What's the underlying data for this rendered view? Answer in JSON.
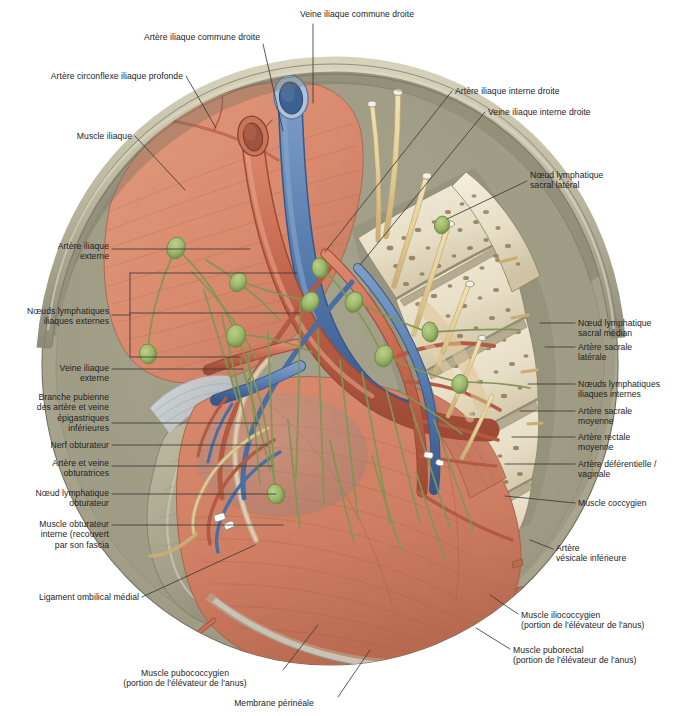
{
  "figure": {
    "type": "anatomical-illustration",
    "language": "fr",
    "palette": {
      "artery": "#c4684f",
      "artery_dark": "#9e4a36",
      "vein": "#5a7fb0",
      "vein_dark": "#3c5f8e",
      "lymph_vessel": "#7f9654",
      "lymph_node": "#9ab668",
      "nerve": "#e3cf9a",
      "nerve_dark": "#c4ab6c",
      "muscle": "#d98a6e",
      "muscle_dark": "#bb6b50",
      "bone": "#efe7d4",
      "bone_spot": "#8a7352",
      "fascia": "#b3b09a",
      "peritoneum": "#c9c6ab",
      "rim": "#b9b49a",
      "shadow": "#7d7b6c",
      "label_text": "#1d1d1f",
      "leader": "#3a3a3a"
    },
    "labels": [
      {
        "id": "veine-iliaque-commune-droite",
        "text": "Veine iliaque commune droite",
        "align": "center",
        "x": 277,
        "y": 9,
        "w": 160
      },
      {
        "id": "artere-iliaque-commune-droite",
        "text": "Artère iliaque commune droite",
        "align": "right",
        "x": 8,
        "y": 32,
        "w": 252
      },
      {
        "id": "artere-circonflexe-iliaque-profonde",
        "text": "Artère circonflexe iliaque profonde",
        "align": "right",
        "x": 6,
        "y": 71,
        "w": 177
      },
      {
        "id": "muscle-iliaque",
        "text": "Muscle iliaque",
        "align": "right",
        "x": 6,
        "y": 131,
        "w": 126
      },
      {
        "id": "artere-iliaque-interne-droite",
        "text": "Artère iliaque interne droite",
        "align": "left",
        "x": 455,
        "y": 86,
        "w": 180
      },
      {
        "id": "veine-iliaque-interne-droite",
        "text": "Veine iliaque interne droite",
        "align": "left",
        "x": 488,
        "y": 107,
        "w": 180
      },
      {
        "id": "noeud-lymphatique-sacral-lateral",
        "text": "Nœud lymphatique\nsacral latéral",
        "align": "left",
        "x": 530,
        "y": 170,
        "w": 140
      },
      {
        "id": "artere-iliaque-externe",
        "text": "Artère iliaque\nexterne",
        "align": "right",
        "x": 6,
        "y": 241,
        "w": 103
      },
      {
        "id": "noeuds-lymphatiques-iliaques-externes",
        "text": "Nœuds lymphatiques\niliaques externes",
        "align": "right",
        "x": 2,
        "y": 306,
        "w": 107
      },
      {
        "id": "veine-iliaque-externe",
        "text": "Veine iliaque\nexterne",
        "align": "right",
        "x": 6,
        "y": 363,
        "w": 103
      },
      {
        "id": "branche-pubienne",
        "text": "Branche pubienne\ndes artère et veine\népigastriques\ninférieures",
        "align": "right",
        "x": 6,
        "y": 392,
        "w": 103
      },
      {
        "id": "nerf-obturateur",
        "text": "Nerf obturateur",
        "align": "right",
        "x": 6,
        "y": 440,
        "w": 103
      },
      {
        "id": "artere-et-veine-obturatrices",
        "text": "Artère et veine\nobturatrices",
        "align": "right",
        "x": 6,
        "y": 458,
        "w": 103
      },
      {
        "id": "noeud-lymphatique-obturateur",
        "text": "Nœud lymphatique\nobturateur",
        "align": "right",
        "x": 6,
        "y": 488,
        "w": 103
      },
      {
        "id": "muscle-obturateur-interne",
        "text": "Muscle obturateur\ninterne (recouvert\npar son fascia",
        "align": "right",
        "x": 6,
        "y": 519,
        "w": 103
      },
      {
        "id": "ligament-ombilical-medial",
        "text": "Ligament ombilical médial",
        "align": "right",
        "x": 6,
        "y": 592,
        "w": 133
      },
      {
        "id": "noeud-lymphatique-sacral-median",
        "text": "Nœud lymphatique\nsacral médian",
        "align": "left",
        "x": 578,
        "y": 318,
        "w": 95
      },
      {
        "id": "artere-sacrale-laterale",
        "text": "Artère sacrale\nlatérale",
        "align": "left",
        "x": 578,
        "y": 342,
        "w": 95
      },
      {
        "id": "noeuds-lymphatiques-iliaques-internes",
        "text": "Nœuds lymphatiques\niliaques internes",
        "align": "left",
        "x": 578,
        "y": 379,
        "w": 95
      },
      {
        "id": "artere-sacrale-moyenne",
        "text": "Artère sacrale\nmoyenne",
        "align": "left",
        "x": 578,
        "y": 406,
        "w": 95
      },
      {
        "id": "artere-rectale-moyenne",
        "text": "Artère rectale\nmoyenne",
        "align": "left",
        "x": 578,
        "y": 432,
        "w": 95
      },
      {
        "id": "artere-deferentielle-vaginale",
        "text": "Artère déférentielle /\nvaginale",
        "align": "left",
        "x": 578,
        "y": 459,
        "w": 95
      },
      {
        "id": "muscle-coccygien",
        "text": "Muscle coccygien",
        "align": "left",
        "x": 578,
        "y": 498,
        "w": 95
      },
      {
        "id": "artere-vesicale-inferieure",
        "text": "Artère\nvésicale inférieure",
        "align": "left",
        "x": 556,
        "y": 543,
        "w": 117
      },
      {
        "id": "muscle-iliococcygien",
        "text": "Muscle iliococcygien\n(portion de l'élévateur de l'anus)",
        "align": "left",
        "x": 521,
        "y": 610,
        "w": 152
      },
      {
        "id": "muscle-puborectal",
        "text": "Muscle puborectal\n(portion de l'élévateur de l'anus)",
        "align": "left",
        "x": 513,
        "y": 645,
        "w": 160
      },
      {
        "id": "muscle-pubococcygien",
        "text": "Muscle pubococcygien\n(portion de l'élévateur de l'anus)",
        "align": "center",
        "x": 90,
        "y": 668,
        "w": 190
      },
      {
        "id": "membrane-perineale",
        "text": "Membrane périnéale",
        "align": "center",
        "x": 213,
        "y": 698,
        "w": 122
      }
    ],
    "leaders": [
      {
        "id": "leader-veine-iliaque-commune-droite",
        "d": "M 313 24 L 313 103"
      },
      {
        "id": "leader-artere-iliaque-commune-droite",
        "d": "M 263 44 L 283 131"
      },
      {
        "id": "leader-artere-circonflexe-iliaque-profonde",
        "d": "M 186 76 L 216 128"
      },
      {
        "id": "leader-muscle-iliaque",
        "d": "M 135 136 L 185 190"
      },
      {
        "id": "leader-artere-iliaque-interne-droite",
        "d": "M 452 91 L 325 252"
      },
      {
        "id": "leader-veine-iliaque-interne-droite",
        "d": "M 485 112 L 360 265"
      },
      {
        "id": "leader-noeud-lymphatique-sacral-lateral",
        "d": "M 527 181 L 447 219"
      },
      {
        "id": "leader-artere-iliaque-externe",
        "d": "M 112 249 L 250 249"
      },
      {
        "id": "leader-noeud-lymph-ext-1",
        "d": "M 130 273 L 297 273"
      },
      {
        "id": "leader-noeud-lymph-ext-2",
        "d": "M 130 313 L 300 313"
      },
      {
        "id": "leader-noeud-lymph-ext-bracket",
        "d": "M 130 273 L 130 357 M 112 315 L 130 315 M 130 357 L 240 357"
      },
      {
        "id": "leader-veine-iliaque-externe",
        "d": "M 112 369 L 243 369"
      },
      {
        "id": "leader-branche-pubienne",
        "d": "M 112 423 L 258 423"
      },
      {
        "id": "leader-nerf-obturateur",
        "d": "M 112 445 L 268 445"
      },
      {
        "id": "leader-artere-et-veine-obturatrices",
        "d": "M 112 466 L 272 466"
      },
      {
        "id": "leader-noeud-lymphatique-obturateur",
        "d": "M 112 494 L 276 494"
      },
      {
        "id": "leader-muscle-obturateur-interne",
        "d": "M 112 525 L 283 525"
      },
      {
        "id": "leader-ligament-ombilical-medial",
        "d": "M 142 597 L 255 545"
      },
      {
        "id": "leader-noeud-lymphatique-sacral-median",
        "d": "M 575 323 L 540 323"
      },
      {
        "id": "leader-artere-sacrale-laterale",
        "d": "M 575 347 L 545 347"
      },
      {
        "id": "leader-noeuds-lymphatiques-iliaques-internes",
        "d": "M 575 384 L 528 384"
      },
      {
        "id": "leader-artere-sacrale-moyenne",
        "d": "M 575 411 L 520 411"
      },
      {
        "id": "leader-artere-rectale-moyenne",
        "d": "M 575 437 L 512 437"
      },
      {
        "id": "leader-artere-deferentielle-vaginale",
        "d": "M 575 464 L 505 464"
      },
      {
        "id": "leader-muscle-coccygien",
        "d": "M 575 503 L 505 496"
      },
      {
        "id": "leader-artere-vesicale-inferieure",
        "d": "M 553 549 L 530 540"
      },
      {
        "id": "leader-muscle-iliococcygien",
        "d": "M 518 614 L 490 595"
      },
      {
        "id": "leader-muscle-puborectal",
        "d": "M 510 649 L 476 628"
      },
      {
        "id": "leader-muscle-pubococcygien",
        "d": "M 283 670 L 318 625"
      },
      {
        "id": "leader-membrane-perineale",
        "d": "M 338 697 L 370 650"
      }
    ]
  }
}
